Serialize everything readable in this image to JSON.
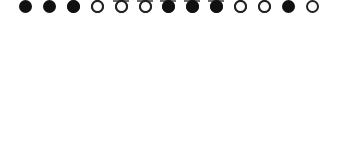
{
  "diagram": {
    "type": "triangular-array",
    "colors": {
      "filled": "#111111",
      "open_border": "#222222",
      "dash": "#6a6a6a",
      "background": "#ffffff"
    },
    "rows": [
      {
        "y": 5,
        "cells": [
          {
            "x": 168,
            "kind": "blank"
          }
        ]
      },
      {
        "y": 29,
        "cells": [
          {
            "x": 145,
            "kind": "blank"
          },
          {
            "x": 192,
            "kind": "blank"
          }
        ]
      },
      {
        "y": 52,
        "cells": [
          {
            "x": 121,
            "kind": "blank"
          },
          {
            "x": 168,
            "kind": "blank"
          },
          {
            "x": 216,
            "kind": "blank"
          }
        ]
      },
      {
        "y": 69,
        "cells": [
          {
            "x": 97,
            "kind": "open"
          },
          {
            "x": 145,
            "kind": "open"
          },
          {
            "x": 192,
            "kind": "filled"
          },
          {
            "x": 240,
            "kind": "filled"
          }
        ]
      },
      {
        "y": 93,
        "cells": [
          {
            "x": 73,
            "kind": "open"
          },
          {
            "x": 121,
            "kind": "filled"
          },
          {
            "x": 168,
            "kind": "open"
          },
          {
            "x": 216,
            "kind": "open"
          },
          {
            "x": 264,
            "kind": "open"
          }
        ]
      },
      {
        "y": 117,
        "cells": [
          {
            "x": 49,
            "kind": "filled"
          },
          {
            "x": 97,
            "kind": "open"
          },
          {
            "x": 145,
            "kind": "open"
          },
          {
            "x": 192,
            "kind": "filled"
          },
          {
            "x": 240,
            "kind": "open"
          },
          {
            "x": 288,
            "kind": "filled"
          }
        ]
      },
      {
        "y": 142,
        "cells": [
          {
            "x": 25,
            "kind": "filled"
          },
          {
            "x": 73,
            "kind": "filled"
          },
          {
            "x": 121,
            "kind": "open"
          },
          {
            "x": 168,
            "kind": "filled"
          },
          {
            "x": 216,
            "kind": "filled"
          },
          {
            "x": 264,
            "kind": "open"
          },
          {
            "x": 312,
            "kind": "open"
          }
        ]
      }
    ]
  }
}
